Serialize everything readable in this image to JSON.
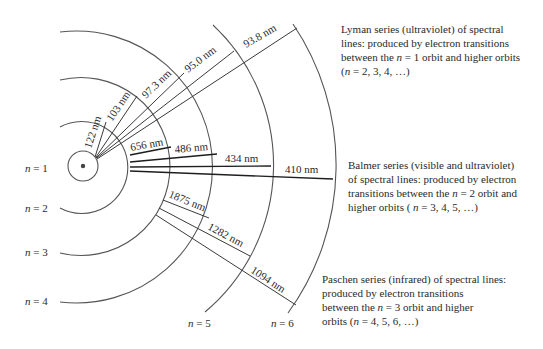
{
  "figure": {
    "type": "hydrogen-atom-orbit-diagram",
    "orbit_labels": [
      {
        "n": "1",
        "text_var": "n",
        "text_eq": " = 1"
      },
      {
        "n": "2",
        "text_var": "n",
        "text_eq": " = 2"
      },
      {
        "n": "3",
        "text_var": "n",
        "text_eq": " = 3"
      },
      {
        "n": "4",
        "text_var": "n",
        "text_eq": " = 4"
      },
      {
        "n": "5",
        "text_var": "n",
        "text_eq": " = 5"
      },
      {
        "n": "6",
        "text_var": "n",
        "text_eq": " = 6"
      }
    ],
    "series": {
      "lyman": {
        "name": "Lyman",
        "lines": [
          {
            "label": "122 nm",
            "from_n": 2,
            "to_n": 1
          },
          {
            "label": "103 nm",
            "from_n": 3,
            "to_n": 1
          },
          {
            "label": "97.3 nm",
            "from_n": 4,
            "to_n": 1
          },
          {
            "label": "95.0 nm",
            "from_n": 5,
            "to_n": 1
          },
          {
            "label": "93.8 nm",
            "from_n": 6,
            "to_n": 1
          }
        ],
        "description_lines": [
          "Lyman series (ultraviolet) of spectral",
          "lines: produced by electron transitions",
          "between the ",
          "n",
          " = 1 orbit and higher orbits",
          "(",
          "n",
          "  = 2, 3, 4, …)"
        ]
      },
      "balmer": {
        "name": "Balmer",
        "lines": [
          {
            "label": "656 nm",
            "from_n": 3,
            "to_n": 2
          },
          {
            "label": "486 nm",
            "from_n": 4,
            "to_n": 2
          },
          {
            "label": "434 nm",
            "from_n": 5,
            "to_n": 2
          },
          {
            "label": "410 nm",
            "from_n": 6,
            "to_n": 2
          }
        ],
        "description_lines": [
          "Balmer series (visible and ultraviolet)",
          "of spectral lines: produced by electron",
          "transitions between the ",
          "n",
          "  = 2 orbit and",
          "higher orbits ( ",
          "n",
          " = 3, 4, 5, …)"
        ]
      },
      "paschen": {
        "name": "Paschen",
        "lines": [
          {
            "label": "1875 nm",
            "from_n": 4,
            "to_n": 3
          },
          {
            "label": "1282 nm",
            "from_n": 5,
            "to_n": 3
          },
          {
            "label": "1094 nm",
            "from_n": 6,
            "to_n": 3
          }
        ],
        "description_lines": [
          "Paschen series (infrared) of spectral lines:",
          "produced by electron transitions",
          "between the ",
          "n",
          " = 3 orbit and higher",
          "orbits (",
          "n",
          " = 4, 5, 6, …)"
        ]
      }
    }
  }
}
